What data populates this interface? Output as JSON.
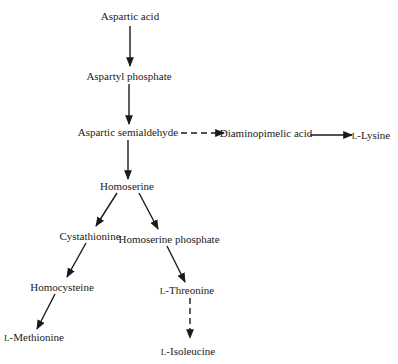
{
  "diagram": {
    "nodes": [
      {
        "id": "asp",
        "label": "Aspartic acid",
        "x": 130,
        "y": 16
      },
      {
        "id": "aspp",
        "label": "Aspartyl phosphate",
        "x": 129,
        "y": 76
      },
      {
        "id": "asa",
        "label": "Aspartic semialdehyde",
        "x": 128,
        "y": 132
      },
      {
        "id": "dap",
        "label": "Diaminopimelic acid",
        "x": 266,
        "y": 133
      },
      {
        "id": "lys",
        "prefix": "L",
        "label": "-Lysine",
        "x": 371,
        "y": 135
      },
      {
        "id": "hse",
        "label": "Homoserine",
        "x": 127,
        "y": 186
      },
      {
        "id": "cys",
        "label": "Cystathionine",
        "x": 90,
        "y": 236
      },
      {
        "id": "hsp",
        "label": "Homoserine phosphate",
        "x": 169,
        "y": 239
      },
      {
        "id": "hcy",
        "label": "Homocysteine",
        "x": 62,
        "y": 287
      },
      {
        "id": "thr",
        "prefix": "L",
        "label": "-Threonine",
        "x": 187,
        "y": 290
      },
      {
        "id": "met",
        "prefix": "L",
        "label": "-Methionine",
        "x": 34,
        "y": 337
      },
      {
        "id": "ile",
        "prefix": "L",
        "label": "-Isoleucine",
        "x": 188,
        "y": 351
      }
    ],
    "edges": [
      {
        "from": "asp",
        "to": "aspp",
        "style": "solid",
        "x1": 130,
        "y1": 26,
        "x2": 130,
        "y2": 66
      },
      {
        "from": "aspp",
        "to": "asa",
        "style": "solid",
        "x1": 129,
        "y1": 84,
        "x2": 129,
        "y2": 124
      },
      {
        "from": "asa",
        "to": "dap",
        "style": "dashed",
        "x1": 181,
        "y1": 133,
        "x2": 224,
        "y2": 133
      },
      {
        "from": "dap",
        "to": "lys",
        "style": "solid",
        "x1": 310,
        "y1": 135,
        "x2": 352,
        "y2": 135
      },
      {
        "from": "asa",
        "to": "hse",
        "style": "solid",
        "x1": 128,
        "y1": 140,
        "x2": 128,
        "y2": 179
      },
      {
        "from": "hse",
        "to": "cys",
        "style": "solid",
        "x1": 117,
        "y1": 193,
        "x2": 96,
        "y2": 226
      },
      {
        "from": "hse",
        "to": "hsp",
        "style": "solid",
        "x1": 139,
        "y1": 193,
        "x2": 158,
        "y2": 229
      },
      {
        "from": "cys",
        "to": "hcy",
        "style": "solid",
        "x1": 86,
        "y1": 243,
        "x2": 67,
        "y2": 277
      },
      {
        "from": "hsp",
        "to": "thr",
        "style": "solid",
        "x1": 167,
        "y1": 246,
        "x2": 185,
        "y2": 282
      },
      {
        "from": "hcy",
        "to": "met",
        "style": "solid",
        "x1": 55,
        "y1": 294,
        "x2": 37,
        "y2": 329
      },
      {
        "from": "thr",
        "to": "ile",
        "style": "dashed",
        "x1": 190,
        "y1": 298,
        "x2": 190,
        "y2": 338
      }
    ]
  }
}
